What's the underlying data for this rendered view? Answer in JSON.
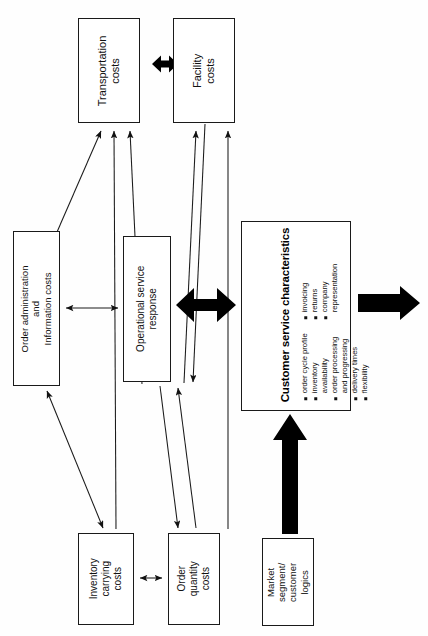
{
  "diagram": {
    "boxes": {
      "transportation": {
        "lines": [
          "Transportation",
          "costs"
        ]
      },
      "facility": {
        "lines": [
          "Facility",
          "costs"
        ]
      },
      "order_admin": {
        "lines": [
          "Order administration",
          "and",
          "Information costs"
        ]
      },
      "op_service": {
        "lines": [
          "Operational service",
          "response"
        ]
      },
      "inventory": {
        "lines": [
          "Inventory",
          "carrying",
          "costs"
        ]
      },
      "order_qty": {
        "lines": [
          "Order",
          "quantity",
          "costs"
        ]
      },
      "market": {
        "lines": [
          "Market",
          "segment/",
          "customer",
          "logics"
        ]
      },
      "customer_service": {
        "title": "Customer service characteristics",
        "bullets_left": [
          "order cycle profile",
          "inventory",
          "availability",
          "order processing",
          "and progressing",
          "delivery times",
          "flexibility"
        ],
        "bullets_left_flags": [
          true,
          true,
          false,
          true,
          false,
          true,
          true
        ],
        "bullets_right": [
          "invoicing",
          "returns",
          "company",
          "representation"
        ],
        "bullets_right_flags": [
          true,
          true,
          true,
          false
        ]
      }
    },
    "colors": {
      "stroke": "#1a1a1a",
      "fill": "#ffffff",
      "bold_arrow": "#000000"
    }
  }
}
